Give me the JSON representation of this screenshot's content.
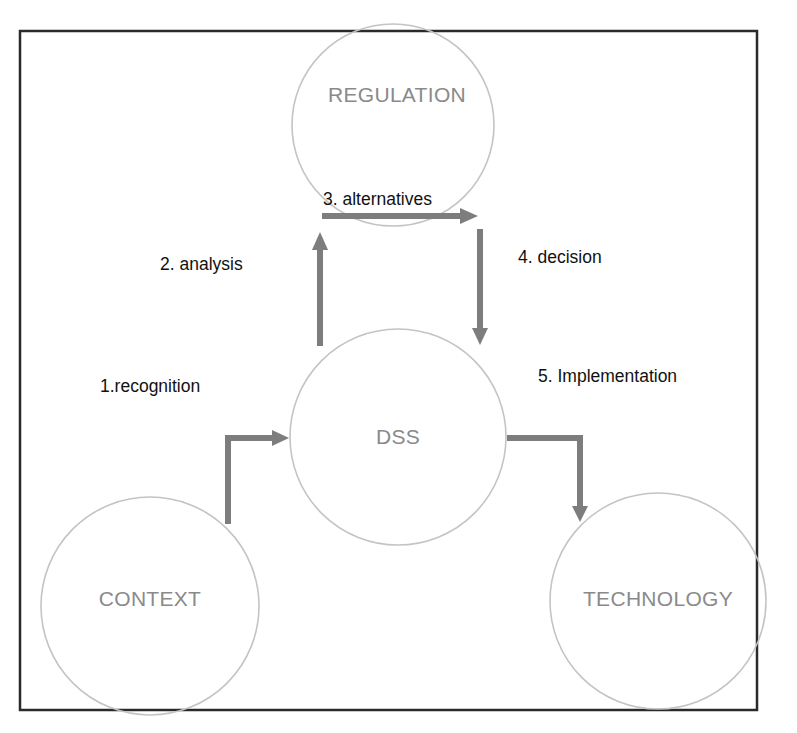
{
  "diagram": {
    "type": "process-flow",
    "colors": {
      "frame": "#2a2a2a",
      "node_outline": "#c4c4c4",
      "node_text": "#8a8a8a",
      "arrow": "#7d7d7d",
      "edge_text": "#111111",
      "background": "#ffffff"
    },
    "nodes": [
      {
        "id": "regulation",
        "label": "REGULATION"
      },
      {
        "id": "dss",
        "label": "DSS"
      },
      {
        "id": "context",
        "label": "CONTEXT"
      },
      {
        "id": "technology",
        "label": "TECHNOLOGY"
      }
    ],
    "edges": [
      {
        "step": 1,
        "from": "context",
        "to": "dss",
        "label": "1.recognition"
      },
      {
        "step": 2,
        "from": "dss",
        "to": "regulation",
        "label": "2. analysis"
      },
      {
        "step": 3,
        "from": "regulation",
        "to": "regulation",
        "label": "3. alternatives"
      },
      {
        "step": 4,
        "from": "regulation",
        "to": "dss",
        "label": "4. decision"
      },
      {
        "step": 5,
        "from": "dss",
        "to": "technology",
        "label": "5. Implementation"
      }
    ]
  }
}
